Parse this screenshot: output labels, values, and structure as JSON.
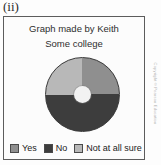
{
  "item_label": "(ii)",
  "figure": {
    "title": "Graph made by Keith",
    "subtitle": "Some college"
  },
  "legend": {
    "items": [
      {
        "label": "Yes",
        "color": "#8f8f8f",
        "swatch_name": "legend-swatch-yes"
      },
      {
        "label": "No",
        "color": "#3d3d3d",
        "swatch_name": "legend-swatch-no"
      },
      {
        "label": "Not at all sure",
        "color": "#b8b8b8",
        "swatch_name": "legend-swatch-not-at-all-sure"
      }
    ]
  },
  "credit": "Copyright © Pearson Education",
  "chart_data": {
    "type": "pie",
    "title": "Graph made by Keith",
    "subtitle": "Some college",
    "categories": [
      "Yes",
      "No",
      "Not at all sure"
    ],
    "values": [
      25,
      50,
      25
    ],
    "unit": "percent",
    "colors": [
      "#8f8f8f",
      "#3d3d3d",
      "#b8b8b8"
    ],
    "legend_position": "bottom",
    "donut_hole": true,
    "start_angle_deg": 0,
    "slice_angles_deg": [
      90,
      180,
      90
    ],
    "labels_shown": false,
    "grid": false
  }
}
